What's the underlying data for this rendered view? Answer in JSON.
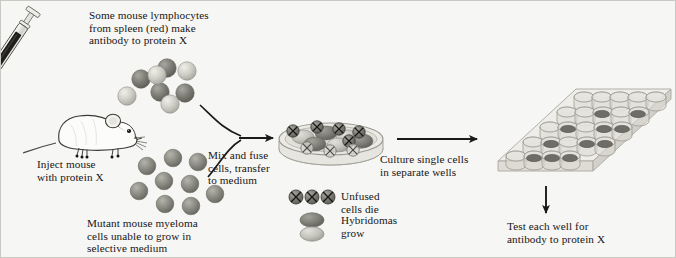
{
  "figure": {
    "background_color": "#f6f6f4",
    "text_color": "#171514",
    "ink_color": "#1a1a1a"
  },
  "labels": {
    "lymphocytes": "Some mouse lymphocytes\nfrom spleen (red) make\nantibody to protein X",
    "inject_mouse": "Inject mouse\nwith protein X",
    "myeloma": "Mutant mouse myeloma\ncells unable to grow in\nselective medium",
    "mix_fuse": "Mix and fuse\ncells, transfer\nto medium",
    "culture_wells": "Culture single cells\nin separate wells",
    "test_wells": "Test each well for\nantibody to protein X"
  },
  "legend": {
    "items": [
      {
        "icon": "crossed-circle-cells-icon",
        "label": "Unfused\ncells die",
        "count": 3,
        "color": "#8f8e88"
      },
      {
        "icon": "stacked-ovals-icon",
        "label": "Hybridomas\ngrow",
        "count": 2,
        "color_top": "#7f7e78",
        "color_bottom": "#c3c2ba"
      }
    ]
  },
  "elements": {
    "syringe": {
      "name": "syringe",
      "barrel_color": "#2a2826",
      "glass_color": "#e6e6e2"
    },
    "mouse": {
      "name": "laboratory-mouse",
      "body_color": "#fbfbf9",
      "outline_color": "#3a3834"
    },
    "petri_dish": {
      "name": "petri-dish",
      "rim_color": "#b9b8b0",
      "fill_color": "#e4e3dd",
      "unfused_cells": 7,
      "hybridoma_cells": 6
    },
    "well_plate": {
      "name": "multiwell-culture-plate",
      "rows": 5,
      "cols": 6,
      "tray_color": "#e2e1db",
      "well_color": "#d4d3cb",
      "filled_wells": 11,
      "pellet_color": "#6e6d66"
    }
  },
  "arrows": [
    {
      "name": "arrow-lymphocytes-to-dish",
      "type": "curved"
    },
    {
      "name": "arrow-myeloma-to-dish",
      "type": "curved"
    },
    {
      "name": "arrow-dish-to-plate",
      "type": "straight-horizontal"
    },
    {
      "name": "arrow-plate-to-test",
      "type": "straight-down"
    }
  ],
  "cell_clusters": {
    "lymphocytes": {
      "name": "lymphocyte-cluster",
      "count": 8,
      "dark_color": "#77766f",
      "light_color": "#c2c1b9"
    },
    "myeloma": {
      "name": "myeloma-cluster",
      "count": 9,
      "color": "#8a8982"
    }
  }
}
